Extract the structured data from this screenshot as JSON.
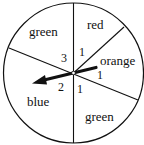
{
  "spinner": {
    "sectors": [
      {
        "label": "green",
        "value": "3"
      },
      {
        "label": "red",
        "value": "1"
      },
      {
        "label": "orange",
        "value": "1"
      },
      {
        "label": "green",
        "value": "1"
      },
      {
        "label": "blue",
        "value": "2"
      }
    ],
    "arrow_points_to": "blue",
    "colors": {
      "stroke": "#111111",
      "background": "#ffffff"
    }
  }
}
